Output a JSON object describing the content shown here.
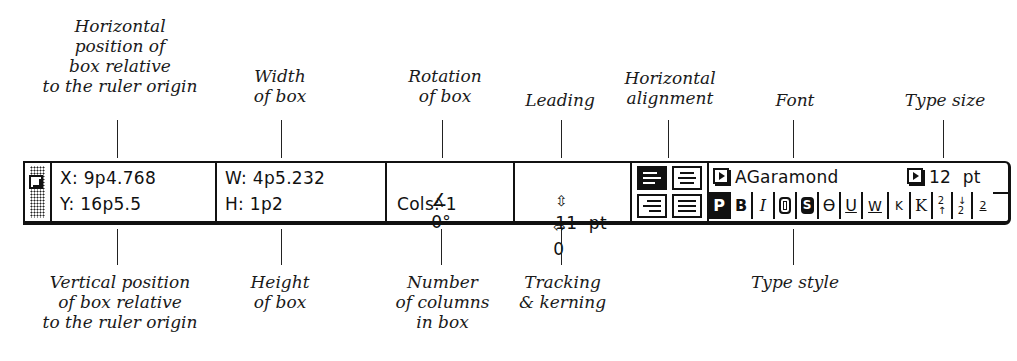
{
  "callouts_top": {
    "horizontal_position": "Horizontal\nposition of\nbox relative\nto the ruler origin",
    "width": "Width\nof box",
    "rotation": "Rotation\nof box",
    "leading": "Leading",
    "horizontal_alignment": "Horizontal\nalignment",
    "font": "Font",
    "type_size": "Type size"
  },
  "callouts_bottom": {
    "vertical_position": "Vertical position\nof box relative\nto the ruler origin",
    "height": "Height\nof box",
    "columns": "Number\nof columns\nin box",
    "tracking": "Tracking\n& kerning",
    "type_style": "Type style"
  },
  "palette": {
    "x": "X: 9p4.768",
    "y": "Y: 16p5.5",
    "w": "W: 4p5.232",
    "h": "H: 1p2",
    "rotation": "0°",
    "cols": "Cols: 1",
    "leading": "11  pt",
    "tracking": "0",
    "font": "AGaramond",
    "size": "12  pt",
    "alignment": [
      "left",
      "centered",
      "right",
      "justified"
    ],
    "alignment_selected": "left",
    "styles": [
      {
        "key": "plain",
        "glyph": "P",
        "on": true
      },
      {
        "key": "bold",
        "glyph": "B",
        "on": false
      },
      {
        "key": "italic",
        "glyph": "I",
        "on": false
      },
      {
        "key": "outline",
        "glyph": "O",
        "on": false
      },
      {
        "key": "shadow",
        "glyph": "S",
        "on": false
      },
      {
        "key": "strikethrough",
        "glyph": "Ө",
        "on": false
      },
      {
        "key": "underline",
        "glyph": "U",
        "on": false
      },
      {
        "key": "word-underline",
        "glyph": "W",
        "on": false
      },
      {
        "key": "small-caps",
        "glyph": "K",
        "on": false
      },
      {
        "key": "all-caps",
        "glyph": "K",
        "on": false
      },
      {
        "key": "superscript",
        "glyph": "2↑",
        "on": false
      },
      {
        "key": "subscript",
        "glyph": "↓2",
        "on": false
      },
      {
        "key": "superior",
        "glyph": "2̲",
        "on": false
      }
    ]
  }
}
